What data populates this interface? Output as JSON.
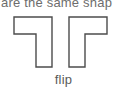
{
  "figure": {
    "caption_top": "are the same shap",
    "label_bottom": "flip",
    "background_color": "#ffffff",
    "stroke_color": "#4c4c4c",
    "fill_color": "#ffffff",
    "text_color": "#5a5a5a",
    "caption_text_color": "#6d6d6d"
  },
  "shapes": [
    {
      "name": "left-l-shape",
      "orientation": "mirrored-l",
      "description": "L-shaped polygon with horizontal bar at top and vertical leg on the right side",
      "points": "14,17 52,17 52,67 36,67 36,34 14,34"
    },
    {
      "name": "right-l-shape",
      "orientation": "l",
      "description": "L-shaped polygon with horizontal bar at top and vertical leg on the left side",
      "points": "107,17 69,17 69,67 85,67 85,34 107,34"
    }
  ]
}
